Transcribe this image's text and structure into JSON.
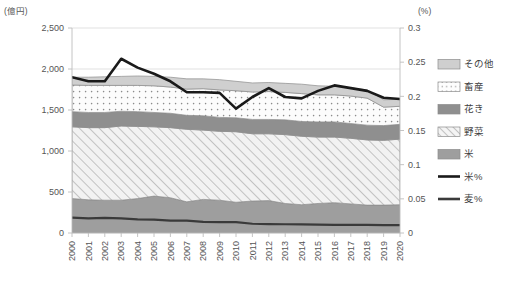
{
  "chart_data": {
    "type": "area",
    "title": "",
    "left_axis_unit": "(億円)",
    "right_axis_unit": "(%)",
    "xlabel": "",
    "ylabel": "",
    "grid": true,
    "legend_position": "right",
    "categories": [
      "2000",
      "2001",
      "2002",
      "2003",
      "2004",
      "2005",
      "2006",
      "2007",
      "2008",
      "2009",
      "2010",
      "2011",
      "2012",
      "2013",
      "2014",
      "2015",
      "2016",
      "2017",
      "2018",
      "2019",
      "2020"
    ],
    "ylim": [
      0,
      2500
    ],
    "yticks": [
      "0",
      "500",
      "1,000",
      "1,500",
      "2,000",
      "2,500"
    ],
    "ylim_right": [
      0,
      0.3
    ],
    "yticks_right": [
      "0",
      "0.05",
      "0.1",
      "0.15",
      "0.2",
      "0.25",
      "0.3"
    ],
    "stacked_series": [
      {
        "name": "米",
        "fill": "solid-gray",
        "color": "#9e9e9e",
        "values": [
          420,
          405,
          400,
          400,
          420,
          450,
          430,
          380,
          410,
          400,
          375,
          390,
          395,
          360,
          345,
          360,
          370,
          355,
          340,
          340,
          345
        ]
      },
      {
        "name": "野菜",
        "fill": "hatch",
        "color": "#efefef",
        "values": [
          875,
          880,
          885,
          905,
          880,
          845,
          855,
          885,
          845,
          840,
          860,
          820,
          815,
          840,
          835,
          810,
          800,
          800,
          795,
          790,
          800
        ]
      },
      {
        "name": "花き",
        "fill": "dark-gray",
        "color": "#8f8f8f",
        "values": [
          185,
          185,
          185,
          180,
          180,
          175,
          175,
          170,
          175,
          170,
          170,
          175,
          175,
          180,
          180,
          185,
          185,
          180,
          180,
          180,
          180
        ]
      },
      {
        "name": "畜産",
        "fill": "dotted",
        "color": "#fbfbfb",
        "values": [
          325,
          330,
          330,
          315,
          320,
          325,
          320,
          320,
          330,
          335,
          330,
          335,
          340,
          335,
          340,
          330,
          330,
          335,
          330,
          225,
          220
        ]
      },
      {
        "name": "その他",
        "fill": "light-gray",
        "color": "#cfcfcf",
        "values": [
          95,
          100,
          105,
          110,
          115,
          115,
          120,
          125,
          120,
          125,
          115,
          110,
          110,
          110,
          115,
          110,
          105,
          100,
          100,
          90,
          85
        ]
      }
    ],
    "line_series": [
      {
        "name": "米%",
        "color": "#1a1a1a",
        "width": 2.6,
        "axis": "right",
        "values": [
          0.228,
          0.222,
          0.222,
          0.255,
          0.242,
          0.233,
          0.222,
          0.206,
          0.206,
          0.205,
          0.182,
          0.199,
          0.212,
          0.199,
          0.197,
          0.208,
          0.216,
          0.212,
          0.208,
          0.198,
          0.196
        ]
      },
      {
        "name": "麦%",
        "color": "#3a3a3a",
        "width": 2.2,
        "axis": "right",
        "values": [
          0.0225,
          0.0215,
          0.0222,
          0.0215,
          0.0198,
          0.0195,
          0.0182,
          0.018,
          0.0162,
          0.016,
          0.016,
          0.0135,
          0.013,
          0.0128,
          0.0125,
          0.0122,
          0.012,
          0.012,
          0.0118,
          0.0115,
          0.0115
        ]
      }
    ],
    "legend": [
      {
        "label": "その他",
        "type": "swatch",
        "fill": "light-gray"
      },
      {
        "label": "畜産",
        "type": "swatch",
        "fill": "dotted"
      },
      {
        "label": "花き",
        "type": "swatch",
        "fill": "dark-gray"
      },
      {
        "label": "野菜",
        "type": "swatch",
        "fill": "hatch"
      },
      {
        "label": "米",
        "type": "swatch",
        "fill": "solid-gray"
      },
      {
        "label": "米%",
        "type": "line",
        "fill": "line-black"
      },
      {
        "label": "麦%",
        "type": "line",
        "fill": "line-dark"
      }
    ]
  }
}
